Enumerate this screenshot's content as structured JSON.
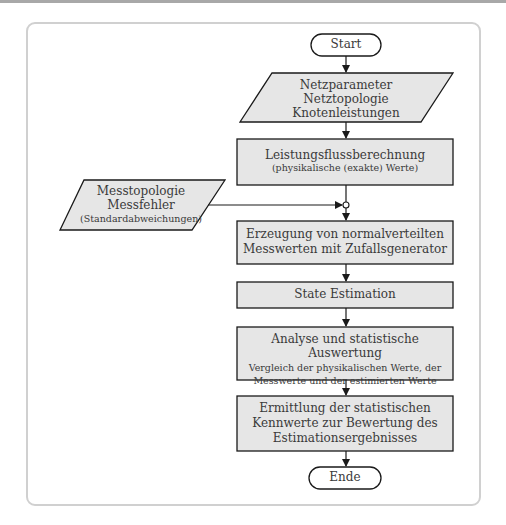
{
  "diagram": {
    "type": "flowchart",
    "colors": {
      "box_fill": "#e6e6e6",
      "stroke": "#1a1a1a",
      "frame_border": "#d0d0d0",
      "text": "#3a3a3a"
    },
    "start": {
      "label": "Start"
    },
    "input_1": {
      "lines": [
        "Netzparameter",
        "Netztopologie",
        "Knotenleistungen"
      ]
    },
    "step_1": {
      "title": "Leistungsflussberechnung",
      "subtitle": "(physikalische (exakte) Werte)"
    },
    "input_2": {
      "lines": [
        "Messtopologie",
        "Messfehler"
      ],
      "subtitle": "(Standardabweichungen)"
    },
    "step_2": {
      "lines": [
        "Erzeugung von normalverteilten",
        "Messwerten mit Zufallsgenerator"
      ]
    },
    "step_3": {
      "title": "State Estimation"
    },
    "step_4": {
      "title": "Analyse und statistische Auswertung",
      "sub_lines": [
        "Vergleich der physikalischen Werte, der",
        "Messwerte und der estimierten Werte"
      ]
    },
    "step_5": {
      "lines": [
        "Ermittlung der statistischen",
        "Kennwerte zur Bewertung des",
        "Estimationsergebnisses"
      ]
    },
    "end": {
      "label": "Ende"
    }
  }
}
